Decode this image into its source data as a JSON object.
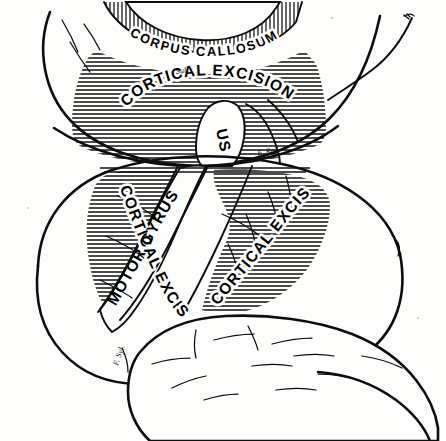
{
  "figure": {
    "background_color": "#fdfdfb",
    "ink_color": "#0d0d0d",
    "views": [
      {
        "name": "superior-medial-view",
        "position": "top"
      },
      {
        "name": "lateral-view",
        "position": "bottom"
      }
    ]
  },
  "labels": {
    "corpus_callosum": "CORPUS CALLOSUM",
    "cortical_excision_top": "CORTICAL EXCISION",
    "cortical_excision_left": "CORTICAL EXCISION",
    "cortical_excision_right": "CORTICAL EXCISION",
    "motor_gyrus": "MOTOR GYRUS",
    "gyrus_upper_fragment": "US",
    "fissure_rolando": "F. Rol.",
    "fissure_sylvius": "F. Syl.",
    "sulcus_top_small": "Sulc."
  },
  "regions": {
    "corpus_callosum_band": {
      "name": "corpus-callosum",
      "hatching": "vertical",
      "label": "CORPUS CALLOSUM"
    },
    "excision_upper": {
      "name": "cortical-excision-superior",
      "hatching": "horizontal",
      "label": "CORTICAL EXCISION"
    },
    "excision_anterior": {
      "name": "cortical-excision-anterior",
      "hatching": "horizontal",
      "label": "CORTICAL EXCISION"
    },
    "excision_posterior": {
      "name": "cortical-excision-posterior",
      "hatching": "horizontal",
      "label": "CORTICAL EXCISION"
    },
    "motor_gyrus_band": {
      "name": "motor-gyrus",
      "hatching": "none",
      "label": "MOTOR GYRUS"
    },
    "temporal_lobe": {
      "name": "temporal-lobe",
      "hatching": "none",
      "label": ""
    },
    "frontal_lobe": {
      "name": "frontal-lobe",
      "hatching": "none",
      "label": ""
    },
    "parieto_occipital": {
      "name": "parieto-occipital-lobe",
      "hatching": "none",
      "label": ""
    }
  }
}
